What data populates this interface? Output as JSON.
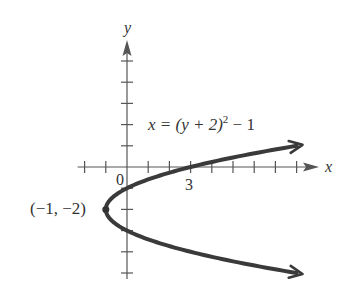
{
  "chart_data": {
    "type": "line",
    "title": "",
    "equation": {
      "lhs": "x = (y + 2)",
      "exponent": "2",
      "rhs": " − 1"
    },
    "xlabel": "x",
    "ylabel": "y",
    "xlim": [
      -2,
      8
    ],
    "ylim": [
      -5,
      5
    ],
    "x_ticks": [
      -2,
      -1,
      0,
      1,
      2,
      3,
      4,
      5,
      6,
      7,
      8
    ],
    "y_ticks": [
      -5,
      -4,
      -3,
      -2,
      -1,
      1,
      2,
      3,
      4,
      5
    ],
    "tick_labels": {
      "origin": "0",
      "x_three": "3"
    },
    "grid": false,
    "series": [
      {
        "name": "x = (y + 2)^2 - 1",
        "relation": "x as function of y",
        "y_range": [
          -5,
          1
        ],
        "sample_points": [
          {
            "x": 8,
            "y": -5
          },
          {
            "x": 3,
            "y": -4
          },
          {
            "x": 0,
            "y": -3
          },
          {
            "x": -1,
            "y": -2
          },
          {
            "x": 0,
            "y": -1
          },
          {
            "x": 3,
            "y": 0
          },
          {
            "x": 8,
            "y": 1
          }
        ],
        "arrow_ends": true
      }
    ],
    "annotations": [
      {
        "text": "(−1, −2)",
        "point": {
          "x": -1,
          "y": -2
        },
        "marker": "dot",
        "placement": "left"
      }
    ]
  }
}
